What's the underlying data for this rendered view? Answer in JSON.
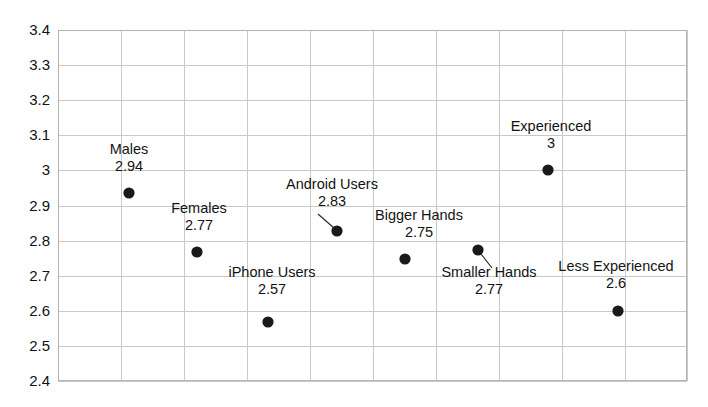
{
  "chart_data": {
    "type": "scatter",
    "title": "",
    "xlabel": "",
    "ylabel": "",
    "ylim": [
      2.4,
      3.4
    ],
    "ytick_labels": [
      "3.4",
      "3.3",
      "3.2",
      "3.1",
      "3",
      "2.9",
      "2.8",
      "2.7",
      "2.6",
      "2.5",
      "2.4"
    ],
    "ytick_values": [
      3.4,
      3.3,
      3.2,
      3.1,
      3.0,
      2.9,
      2.8,
      2.7,
      2.6,
      2.5,
      2.4
    ],
    "grid": true,
    "legend": "none",
    "marker_color": "#1a1a1a",
    "grid_color": "#c8c8c8",
    "categories": [
      "Males",
      "Females",
      "iPhone Users",
      "Android Users",
      "Bigger Hands",
      "Smaller Hands",
      "Experienced",
      "Less Experienced"
    ],
    "values": [
      2.94,
      2.77,
      2.57,
      2.83,
      2.75,
      2.77,
      3,
      2.6
    ],
    "value_labels": [
      "2.94",
      "2.77",
      "2.57",
      "2.83",
      "2.75",
      "2.77",
      "3",
      "2.6"
    ],
    "points": [
      {
        "name": "Males",
        "value": 2.94,
        "value_label": "2.94",
        "px": 129,
        "py": 193,
        "label_x": 129,
        "label_y": 141,
        "leader": null
      },
      {
        "name": "Females",
        "value": 2.77,
        "value_label": "2.77",
        "px": 197,
        "py": 252,
        "label_x": 199,
        "label_y": 200,
        "leader": null
      },
      {
        "name": "iPhone Users",
        "value": 2.57,
        "value_label": "2.57",
        "px": 268,
        "py": 322,
        "label_x": 272,
        "label_y": 264,
        "leader": null
      },
      {
        "name": "Android Users",
        "value": 2.83,
        "value_label": "2.83",
        "px": 337,
        "py": 231,
        "label_x": 332,
        "label_y": 176,
        "leader": {
          "x1": 318,
          "y1": 214,
          "x2": 334,
          "y2": 228
        }
      },
      {
        "name": "Bigger Hands",
        "value": 2.75,
        "value_label": "2.75",
        "px": 405,
        "py": 259,
        "label_x": 419,
        "label_y": 207,
        "leader": null
      },
      {
        "name": "Smaller Hands",
        "value": 2.77,
        "value_label": "2.77",
        "px": 478,
        "py": 250,
        "label_x": 489,
        "label_y": 264,
        "leader": {
          "x1": 481,
          "y1": 254,
          "x2": 492,
          "y2": 268
        }
      },
      {
        "name": "Experienced",
        "value": 3,
        "value_label": "3",
        "px": 548,
        "py": 170,
        "label_x": 551,
        "label_y": 118,
        "leader": null
      },
      {
        "name": "Less Experienced",
        "value": 2.6,
        "value_label": "2.6",
        "px": 618,
        "py": 311,
        "label_x": 616,
        "label_y": 258,
        "leader": null
      }
    ]
  },
  "plot": {
    "left": 58,
    "right": 687,
    "top": 30,
    "bottom": 381,
    "v_gridlines": [
      58,
      121,
      184,
      247,
      310,
      373,
      436,
      499,
      562,
      625,
      687
    ],
    "border_color": "#b4b4b4"
  }
}
